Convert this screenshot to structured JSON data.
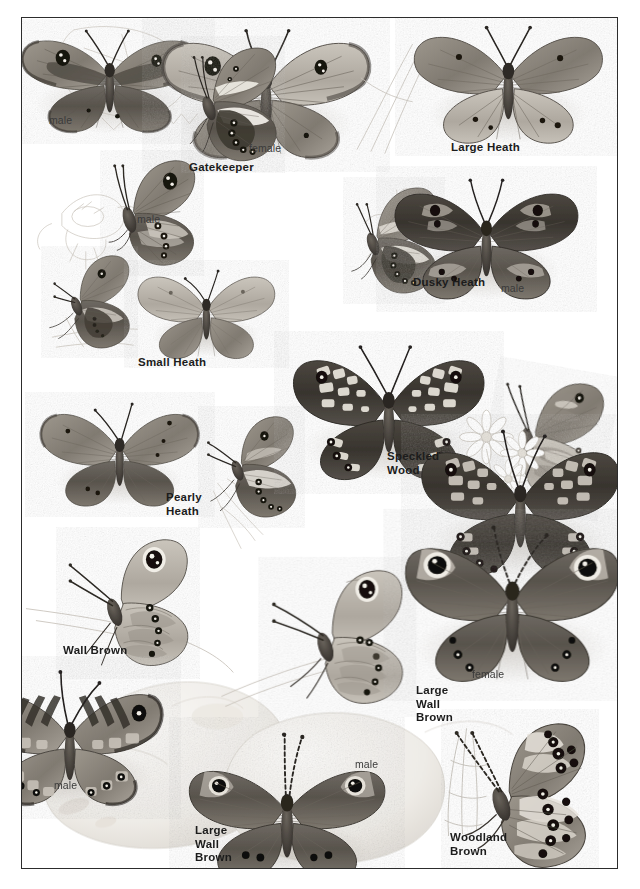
{
  "plate": {
    "title": "Butterfly identification plate",
    "background_color": "#ffffff",
    "frame_color": "#2c2c2c",
    "ink_color": "#1c1c1c"
  },
  "species_labels": [
    {
      "name": "gatekeeper",
      "text": "Gatekeeper",
      "x": 188,
      "y": 160
    },
    {
      "name": "large-heath",
      "text": "Large Heath",
      "x": 450,
      "y": 140
    },
    {
      "name": "dusky-heath",
      "text": "Dusky Heath",
      "x": 412,
      "y": 275
    },
    {
      "name": "small-heath",
      "text": "Small Heath",
      "x": 137,
      "y": 355
    },
    {
      "name": "pearly-heath",
      "text": "Pearly\nHeath",
      "x": 165,
      "y": 490
    },
    {
      "name": "speckled-wood",
      "text": "Speckled\nWood",
      "x": 386,
      "y": 449
    },
    {
      "name": "wall-brown",
      "text": "Wall Brown",
      "x": 62,
      "y": 643
    },
    {
      "name": "large-wall-brown-right",
      "text": "Large\nWall\nBrown",
      "x": 415,
      "y": 683
    },
    {
      "name": "large-wall-brown-bottom",
      "text": "Large\nWall\nBrown",
      "x": 194,
      "y": 823
    },
    {
      "name": "woodland-brown",
      "text": "Woodland\nBrown",
      "x": 449,
      "y": 830
    }
  ],
  "sex_labels": [
    {
      "name": "gatekeeper-male-upperside",
      "text": "male",
      "x": 48,
      "y": 113
    },
    {
      "name": "gatekeeper-female-upperside",
      "text": "female",
      "x": 248,
      "y": 141
    },
    {
      "name": "gatekeeper-male-underside",
      "text": "male",
      "x": 136,
      "y": 212
    },
    {
      "name": "dusky-heath-male",
      "text": "male",
      "x": 500,
      "y": 281
    },
    {
      "name": "large-wall-brown-female",
      "text": "female",
      "x": 471,
      "y": 667
    },
    {
      "name": "wall-brown-male",
      "text": "male",
      "x": 53,
      "y": 778
    },
    {
      "name": "large-wall-brown-male",
      "text": "male",
      "x": 354,
      "y": 757
    }
  ],
  "specimens": [
    {
      "name": "gatekeeper-male-upperside",
      "species": "Gatekeeper",
      "view": "upperside",
      "sex": "male"
    },
    {
      "name": "gatekeeper-female-upperside",
      "species": "Gatekeeper",
      "view": "upperside",
      "sex": "female"
    },
    {
      "name": "gatekeeper-male-underside",
      "species": "Gatekeeper",
      "view": "underside",
      "sex": "male"
    },
    {
      "name": "large-heath-underside",
      "species": "Large Heath",
      "view": "underside",
      "sex": ""
    },
    {
      "name": "large-heath-upperside",
      "species": "Large Heath",
      "view": "upperside",
      "sex": ""
    },
    {
      "name": "dusky-heath-underside",
      "species": "Dusky Heath",
      "view": "underside",
      "sex": ""
    },
    {
      "name": "dusky-heath-male-upperside",
      "species": "Dusky Heath",
      "view": "upperside",
      "sex": "male"
    },
    {
      "name": "small-heath-underside",
      "species": "Small Heath",
      "view": "underside",
      "sex": ""
    },
    {
      "name": "small-heath-upperside",
      "species": "Small Heath",
      "view": "upperside",
      "sex": ""
    },
    {
      "name": "pearly-heath-upperside",
      "species": "Pearly Heath",
      "view": "upperside",
      "sex": ""
    },
    {
      "name": "pearly-heath-underside",
      "species": "Pearly Heath",
      "view": "underside",
      "sex": ""
    },
    {
      "name": "speckled-wood-upperside-1",
      "species": "Speckled Wood",
      "view": "upperside",
      "sex": ""
    },
    {
      "name": "speckled-wood-underside",
      "species": "Speckled Wood",
      "view": "underside",
      "sex": ""
    },
    {
      "name": "speckled-wood-upperside-2",
      "species": "Speckled Wood",
      "view": "upperside",
      "sex": ""
    },
    {
      "name": "wall-brown-underside",
      "species": "Wall Brown",
      "view": "underside",
      "sex": ""
    },
    {
      "name": "wall-brown-male-upperside",
      "species": "Wall Brown",
      "view": "upperside",
      "sex": "male"
    },
    {
      "name": "large-wall-brown-underside",
      "species": "Large Wall Brown",
      "view": "underside",
      "sex": ""
    },
    {
      "name": "large-wall-brown-female",
      "species": "Large Wall Brown",
      "view": "upperside",
      "sex": "female"
    },
    {
      "name": "large-wall-brown-male",
      "species": "Large Wall Brown",
      "view": "upperside",
      "sex": "male"
    },
    {
      "name": "woodland-brown-underside",
      "species": "Woodland Brown",
      "view": "underside",
      "sex": ""
    }
  ]
}
